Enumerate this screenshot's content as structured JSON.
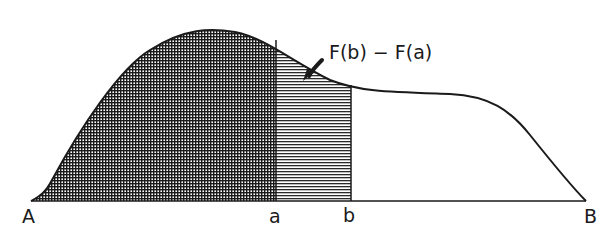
{
  "diagram": {
    "annotation": "F(b) − F(a)",
    "labels": {
      "A": "A",
      "a": "a",
      "b": "b",
      "B": "B"
    },
    "regions": [
      {
        "name": "area-from-A-to-a",
        "pattern": "crosshatch",
        "represents": "F(a)"
      },
      {
        "name": "area-from-a-to-b",
        "pattern": "horizontal-hatch",
        "represents": "F(b) − F(a)"
      },
      {
        "name": "area-from-b-to-B",
        "pattern": "none"
      }
    ],
    "colors": {
      "ink": "#1a1a1a",
      "background": "#ffffff"
    }
  }
}
